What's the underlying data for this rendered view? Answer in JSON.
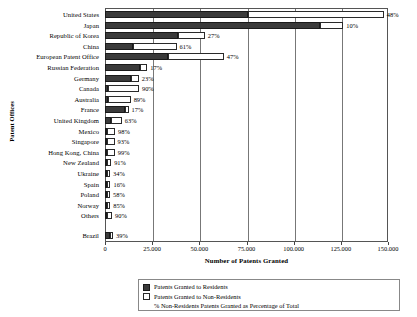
{
  "chart_data": {
    "type": "bar",
    "orientation": "horizontal",
    "stacked": true,
    "title": "",
    "xlabel": "Number of Patents Granted",
    "ylabel": "Patent Offices",
    "xlim": [
      0,
      150000
    ],
    "xticks": [
      0,
      25000,
      50000,
      75000,
      100000,
      125000,
      150000
    ],
    "xtick_labels": [
      "0",
      "25.000",
      "50.000",
      "75.000",
      "100.000",
      "125.000",
      "150.000"
    ],
    "grid": true,
    "legend_position": "bottom",
    "categories": [
      "United States",
      "Japan",
      "Republic of Korea",
      "China",
      "European Patent Office",
      "Russian Federation",
      "Germany",
      "Canada",
      "Australia",
      "France",
      "United Kingdom",
      "Mexico",
      "Singapore",
      "Hong Kong, China",
      "New Zealand",
      "Ukraine",
      "Spain",
      "Poland",
      "Norway",
      "Others",
      "Brazil"
    ],
    "series": [
      {
        "name": "Patents Granted to Residents",
        "color": "#3a3a3a",
        "values": [
          75800,
          113900,
          38700,
          14800,
          33400,
          18600,
          13800,
          1800,
          1500,
          10400,
          3300,
          300,
          300,
          100,
          200,
          900,
          1300,
          700,
          300,
          300,
          2600
        ]
      },
      {
        "name": "Patents Granted to Non-Residents",
        "color": "#ffffff",
        "values": [
          72000,
          12400,
          14200,
          23100,
          29600,
          3800,
          4100,
          16200,
          12100,
          2100,
          5600,
          4300,
          4000,
          4100,
          2200,
          500,
          250,
          1000,
          1700,
          2700,
          1700
        ]
      }
    ],
    "percent_labels": [
      "48%",
      "10%",
      "27%",
      "61%",
      "47%",
      "17%",
      "23%",
      "90%",
      "89%",
      "17%",
      "63%",
      "98%",
      "93%",
      "99%",
      "91%",
      "34%",
      "16%",
      "58%",
      "85%",
      "90%",
      "39%"
    ],
    "percent_series_name": "% Non-Residents Patents Granted as Percentage of Total"
  },
  "legend": {
    "item_residents": "Patents Granted to Residents",
    "item_nonresidents": "Patents Granted to Non-Residents",
    "item_percentage": "% Non-Residents Patents Granted as Percentage of Total"
  }
}
